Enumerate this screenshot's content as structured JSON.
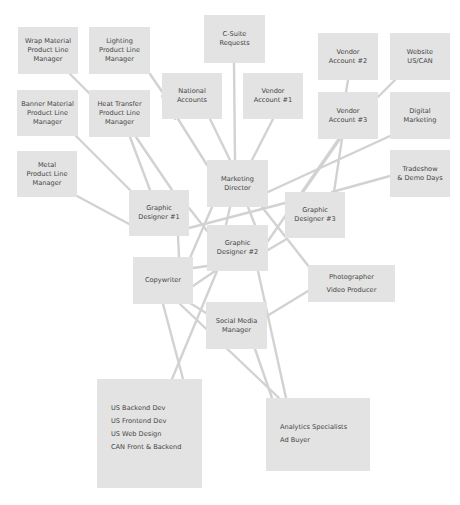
{
  "diagram": {
    "colors": {
      "background": "#ffffff",
      "node_fill": "#e3e3e3",
      "edge": "#d2d2d2",
      "text": "#454545"
    },
    "nodes": {
      "wrap_material": {
        "lines": [
          "Wrap Material",
          "Product Line",
          "Manager"
        ]
      },
      "lighting": {
        "lines": [
          "Lighting",
          "Product Line",
          "Manager"
        ]
      },
      "c_suite": {
        "lines": [
          "C-Suite",
          "Requests"
        ]
      },
      "vendor2": {
        "lines": [
          "Vendor",
          "Account #2"
        ]
      },
      "website": {
        "lines": [
          "Website",
          "US/CAN"
        ]
      },
      "national": {
        "lines": [
          "National",
          "Accounts"
        ]
      },
      "vendor1": {
        "lines": [
          "Vendor",
          "Account #1"
        ]
      },
      "banner_material": {
        "lines": [
          "Banner Material",
          "Product Line",
          "Manager"
        ]
      },
      "heat_transfer": {
        "lines": [
          "Heat Transfer",
          "Product Line",
          "Manager"
        ]
      },
      "vendor3": {
        "lines": [
          "Vendor",
          "Account #3"
        ]
      },
      "digital_marketing": {
        "lines": [
          "Digital",
          "Marketing"
        ]
      },
      "metal": {
        "lines": [
          "Metal",
          "Product Line",
          "Manager"
        ]
      },
      "marketing_director": {
        "lines": [
          "Marketing",
          "Director"
        ]
      },
      "tradeshow": {
        "lines": [
          "Tradeshow",
          "& Demo Days"
        ]
      },
      "graphic_designer1": {
        "lines": [
          "Graphic",
          "Designer #1"
        ]
      },
      "graphic_designer3": {
        "lines": [
          "Graphic",
          "Designer #3"
        ]
      },
      "graphic_designer2": {
        "lines": [
          "Graphic",
          "Designer #2"
        ]
      },
      "copywriter": {
        "lines": [
          "Copywriter"
        ]
      },
      "photographer": {
        "lines": [
          "Photographer",
          "Video Producer"
        ]
      },
      "social_media": {
        "lines": [
          "Social Media",
          "Manager"
        ]
      },
      "web_dev": {
        "lines": [
          "US Backend Dev",
          "US Frontend Dev",
          "US Web Design",
          "CAN Front & Backend"
        ]
      },
      "analytics": {
        "lines": [
          "Analytics Specialists",
          "Ad Buyer"
        ]
      }
    }
  }
}
